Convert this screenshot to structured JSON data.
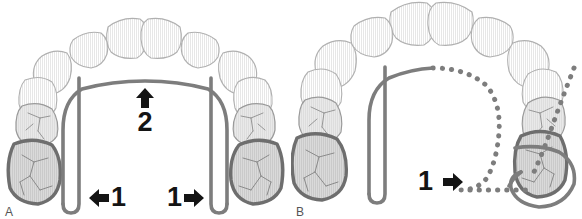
{
  "figure": {
    "panels": [
      {
        "id": "A",
        "label": "A",
        "caption": "Lingual arch appliance seated bilaterally on maxillary first molars with adjustment loops",
        "wire_style": "solid",
        "markers": [
          {
            "id": "force-a-left",
            "number": "1",
            "arrow": "arrow-left-icon",
            "direction": "left",
            "order": "arrow-then-number"
          },
          {
            "id": "force-a-right",
            "number": "1",
            "arrow": "arrow-right-icon",
            "direction": "right",
            "order": "number-then-arrow"
          },
          {
            "id": "force-a-up",
            "number": "2",
            "arrow": "arrow-up-icon",
            "direction": "up",
            "order": "arrow-above-number"
          }
        ]
      },
      {
        "id": "B",
        "label": "B",
        "caption": "Unilateral distalization: right appliance arm displaced distally, original position shown dotted",
        "wire_style": "solid-left-dotted-right",
        "markers": [
          {
            "id": "force-b-right",
            "number": "1",
            "arrow": "arrow-right-icon",
            "direction": "right",
            "order": "number-then-arrow"
          }
        ]
      }
    ]
  },
  "legend": {
    "force_1": "1",
    "force_2": "2"
  },
  "colors": {
    "wire": "#7d7d7d",
    "wire_dark": "#6f6f6f",
    "molar_outline": "#6e6e6e",
    "molar_fill": "#d9d9d9",
    "premolar_fill": "#e6e6e6",
    "anterior_fill": "#f6f6f6",
    "tooth_outline_light": "#b6b6b6",
    "arrow": "#141414",
    "label_text": "#555555",
    "background": "#ffffff"
  }
}
